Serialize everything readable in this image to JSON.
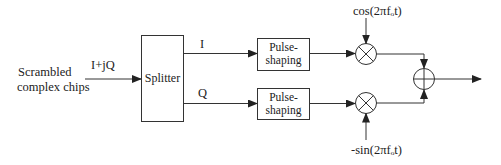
{
  "diagram": {
    "type": "block-diagram",
    "title": "",
    "input": {
      "label_line1": "Scrambled",
      "label_line2": "complex chips",
      "signal": "I+jQ"
    },
    "blocks": {
      "splitter": "Splitter",
      "pulse_shaping_top": {
        "line1": "Pulse-",
        "line2": "shaping"
      },
      "pulse_shaping_bottom": {
        "line1": "Pulse-",
        "line2": "shaping"
      }
    },
    "branches": {
      "upper": "I",
      "lower": "Q"
    },
    "carriers": {
      "upper": "cos(2πfₒt)",
      "lower": "-sin(2πfₒt)"
    },
    "nodes": [
      {
        "id": "mixer-upper",
        "symbol": "multiply"
      },
      {
        "id": "mixer-lower",
        "symbol": "multiply"
      },
      {
        "id": "adder",
        "symbol": "sum"
      }
    ],
    "edges": [
      [
        "input",
        "splitter"
      ],
      [
        "splitter",
        "pulse-shaping-top"
      ],
      [
        "splitter",
        "pulse-shaping-bottom"
      ],
      [
        "pulse-shaping-top",
        "mixer-upper"
      ],
      [
        "pulse-shaping-bottom",
        "mixer-lower"
      ],
      [
        "cos-carrier",
        "mixer-upper"
      ],
      [
        "sin-carrier",
        "mixer-lower"
      ],
      [
        "mixer-upper",
        "adder"
      ],
      [
        "mixer-lower",
        "adder"
      ],
      [
        "adder",
        "output"
      ]
    ],
    "colors": {
      "stroke": "#333333",
      "background": "#ffffff"
    }
  }
}
